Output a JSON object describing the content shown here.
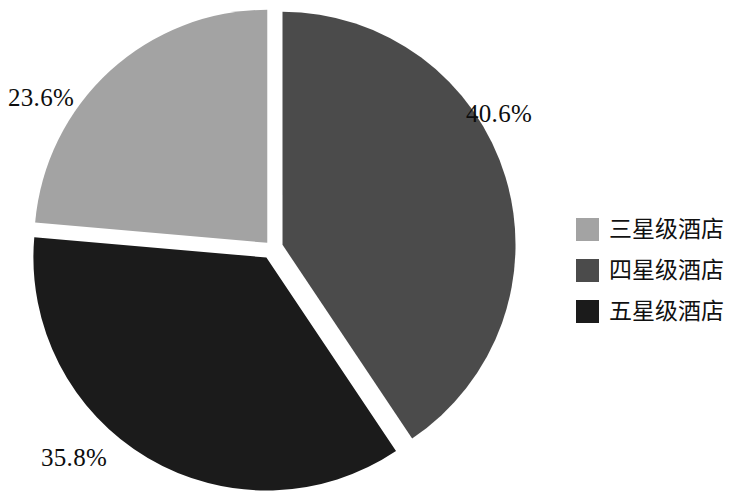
{
  "chart_data": {
    "type": "pie",
    "title": "",
    "subtitle": "",
    "xlabel": "",
    "ylabel": "",
    "grid": false,
    "legend_position": "right",
    "exploded": true,
    "start_angle_deg": 0,
    "direction": "clockwise",
    "categories": [
      "三星级酒店",
      "四星级酒店",
      "五星级酒店"
    ],
    "values": [
      23.6,
      40.6,
      35.8
    ],
    "value_labels": [
      "23.6%",
      "40.6%",
      "35.8%"
    ],
    "colors": [
      "#a3a3a3",
      "#4b4b4b",
      "#1b1b1b"
    ],
    "slices": [
      {
        "name": "三星级酒店",
        "value": 23.6,
        "label": "23.6%",
        "color": "#a3a3a3",
        "start_deg": 275.0,
        "end_deg": 360.0,
        "explode_dir_deg": 317.5,
        "explode_px": 7
      },
      {
        "name": "四星级酒店",
        "value": 40.6,
        "label": "40.6%",
        "color": "#4b4b4b",
        "start_deg": 0.0,
        "end_deg": 146.2,
        "explode_dir_deg": 73.1,
        "explode_px": 11
      },
      {
        "name": "五星级酒店",
        "value": 35.8,
        "label": "35.8%",
        "color": "#1b1b1b",
        "start_deg": 146.2,
        "end_deg": 275.0,
        "explode_dir_deg": 210.6,
        "explode_px": 11
      }
    ]
  },
  "chart": {
    "center_x": 272,
    "center_y": 248,
    "radius": 233,
    "background": "#ffffff",
    "labels": {
      "three_star_pct": "23.6%",
      "four_star_pct": "40.6%",
      "five_star_pct": "35.8%"
    }
  },
  "legend": {
    "items": [
      {
        "label": "三星级酒店",
        "color": "#a3a3a3"
      },
      {
        "label": "四星级酒店",
        "color": "#4b4b4b"
      },
      {
        "label": "五星级酒店",
        "color": "#1b1b1b"
      }
    ]
  }
}
